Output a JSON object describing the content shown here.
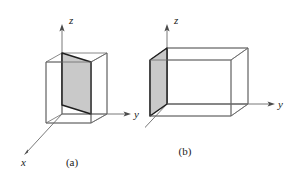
{
  "figure": {
    "background_color": "#ffffff",
    "line_color": "#5a5a5a",
    "bold_line_color": "#1f1f1f",
    "shade_color": "#c9c9c9",
    "panels": [
      {
        "id": "a",
        "caption": "(a)",
        "axes": [
          {
            "name": "z",
            "label": "z",
            "direction": "up"
          },
          {
            "name": "y",
            "label": "y",
            "direction": "right"
          },
          {
            "name": "x",
            "label": "x",
            "direction": "down-left"
          }
        ],
        "shape": "rectangular box with slanted shaded interior plane"
      },
      {
        "id": "b",
        "caption": "(b)",
        "axes": [
          {
            "name": "z",
            "label": "z",
            "direction": "up"
          },
          {
            "name": "y",
            "label": "y",
            "direction": "right"
          },
          {
            "name": "x",
            "label": "x",
            "direction": "down-left"
          }
        ],
        "shape": "rectangular box with shaded left face plane"
      }
    ]
  }
}
